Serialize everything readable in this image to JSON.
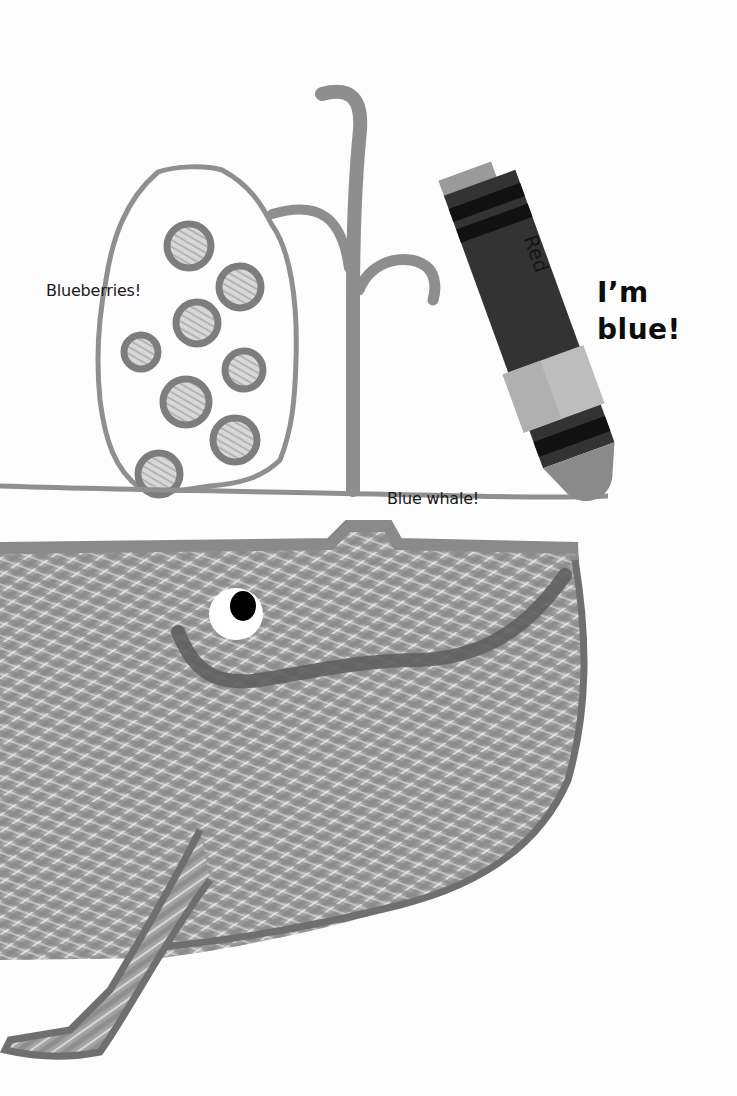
{
  "labels": {
    "blueberries": "Blueberries!",
    "blue_whale": "Blue whale!",
    "speech_line_1": "I’m",
    "speech_line_2": "blue!"
  },
  "crayon": {
    "wrapper_text": "Red",
    "body_color": "#333333",
    "stripe_color": "#111111",
    "tip_color": "#8a8a8a",
    "band_color": "#bdbdbd"
  },
  "colors": {
    "crayon_stroke": "#8c8c8c",
    "whale_fill": "#9a9a9a",
    "outline": "#7d7d7d",
    "background": "#fdfdfd"
  },
  "illustration": {
    "berries_count": 8,
    "subjects": [
      "blueberries",
      "blue-whale",
      "water-spout",
      "crayon"
    ]
  }
}
